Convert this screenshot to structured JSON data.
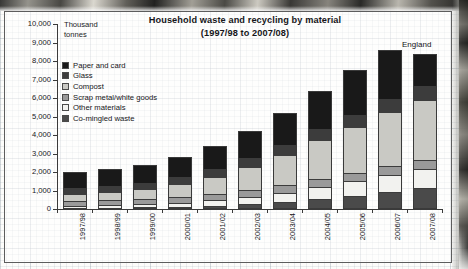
{
  "page": {
    "media": "scanned-book-page",
    "photo_strip_top": true,
    "page_edge_right": true
  },
  "chart_data": {
    "type": "bar",
    "subtype": "stacked-vertical",
    "title": "Household waste and recycling by material",
    "subtitle": "(1997/98 to 2007/08)",
    "title_lines": [
      "Household waste and recycling by material",
      "(1997/98 to 2007/08)"
    ],
    "annotation": "England",
    "ylabel": "Thousand tonnes",
    "ylabel_lines": [
      "Thousand",
      "tonnes"
    ],
    "xlabel": "",
    "ylim": [
      0,
      10000
    ],
    "ytick_step": 1000,
    "ytick_labels": [
      "10,000",
      "9,000",
      "8,000",
      "7,000",
      "6,000",
      "5,000",
      "4,000",
      "3,000",
      "2,000",
      "1,000",
      "0"
    ],
    "ytick_values": [
      10000,
      9000,
      8000,
      7000,
      6000,
      5000,
      4000,
      3000,
      2000,
      1000,
      0
    ],
    "grid": false,
    "legend_position": "upper-left-inside",
    "categories": [
      "1997/98",
      "1998/99",
      "1999/00",
      "2000/01",
      "2001/02",
      "2002/03",
      "2003/04",
      "2004/05",
      "2005/06",
      "2006/07",
      "2007/08"
    ],
    "series": [
      {
        "name": "Co-mingled waste",
        "color": "#4a4a4a",
        "stack_order": 1,
        "values": [
          60,
          70,
          90,
          120,
          170,
          250,
          360,
          520,
          700,
          930,
          1150
        ]
      },
      {
        "name": "Other materials",
        "color": "#f2f2ef",
        "stack_order": 2,
        "values": [
          130,
          150,
          180,
          230,
          300,
          400,
          520,
          660,
          800,
          930,
          1040
        ]
      },
      {
        "name": "Scrap metal/white goods",
        "color": "#9a9a9a",
        "stack_order": 3,
        "values": [
          230,
          250,
          270,
          300,
          330,
          360,
          400,
          430,
          450,
          470,
          480
        ]
      },
      {
        "name": "Compost",
        "color": "#c9c9c4",
        "stack_order": 4,
        "values": [
          380,
          430,
          520,
          700,
          950,
          1250,
          1650,
          2100,
          2500,
          2900,
          3200
        ]
      },
      {
        "name": "Glass",
        "color": "#3c3c3c",
        "stack_order": 5,
        "values": [
          330,
          340,
          360,
          390,
          430,
          480,
          540,
          600,
          660,
          720,
          760
        ]
      },
      {
        "name": "Paper and card",
        "color": "#191919",
        "stack_order": 6,
        "values": [
          870,
          910,
          980,
          1060,
          1220,
          1460,
          1730,
          2090,
          2390,
          2650,
          1770
        ]
      }
    ],
    "totals": [
      2000,
      2150,
      2400,
      2800,
      3400,
      4200,
      5200,
      6400,
      7500,
      8600,
      8400
    ],
    "legend_entries": [
      "Paper and card",
      "Glass",
      "Compost",
      "Scrap metal/white goods",
      "Other materials",
      "Co-mingled waste"
    ]
  },
  "colors": {
    "paper_and_card": "#191919",
    "glass": "#3c3c3c",
    "compost": "#c9c9c4",
    "scrap_metal_white_goods": "#9a9a9a",
    "other_materials": "#f2f2ef",
    "co_mingled_waste": "#4a4a4a",
    "axis": "#3a3a3a",
    "text": "#141417",
    "frame": "#5d5d5d"
  }
}
